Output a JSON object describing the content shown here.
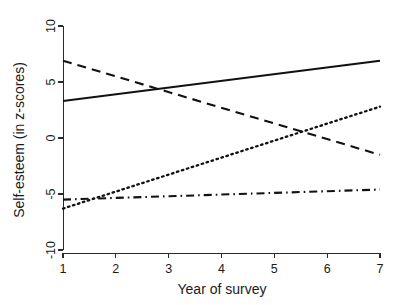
{
  "chart_data": {
    "type": "line",
    "title": "",
    "xlabel": "Year of survey",
    "ylabel": "Self-esteem (in z-scores)",
    "xlim": [
      1,
      7
    ],
    "ylim": [
      -10,
      10
    ],
    "xticks": [
      1,
      2,
      3,
      4,
      5,
      6,
      7
    ],
    "xtick_labels": [
      "1",
      "2",
      "3",
      "4",
      "5",
      "6",
      "7"
    ],
    "yticks": [
      10,
      5,
      0,
      -5,
      -10
    ],
    "ytick_labels": [
      "10",
      "5",
      "0",
      "-5",
      "-10"
    ],
    "grid": false,
    "legend": "none",
    "x": [
      1,
      7
    ],
    "series": [
      {
        "name": "series-solid",
        "style": "solid",
        "color": "#111111",
        "values": [
          3.3,
          6.9
        ]
      },
      {
        "name": "series-dashed",
        "style": "dashed",
        "color": "#111111",
        "values": [
          6.9,
          -1.5
        ]
      },
      {
        "name": "series-dotted",
        "style": "dotted",
        "color": "#111111",
        "values": [
          -6.3,
          2.8
        ]
      },
      {
        "name": "series-dashdot",
        "style": "dash-dot",
        "color": "#111111",
        "values": [
          -5.5,
          -4.6
        ]
      }
    ]
  }
}
